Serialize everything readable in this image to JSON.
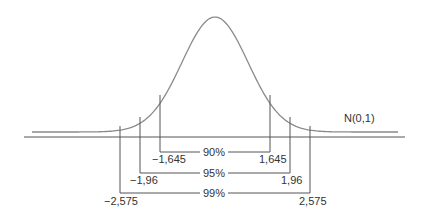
{
  "diagram": {
    "distribution_label": "N(0,1)",
    "colors": {
      "curve": "#8a8a8a",
      "lines": "#555555",
      "text": "#333333"
    },
    "intervals": [
      {
        "confidence": "90%",
        "lower": "−1,645",
        "upper": "1,645"
      },
      {
        "confidence": "95%",
        "lower": "−1,96",
        "upper": "1,96"
      },
      {
        "confidence": "99%",
        "lower": "−2,575",
        "upper": "2,575"
      }
    ]
  }
}
